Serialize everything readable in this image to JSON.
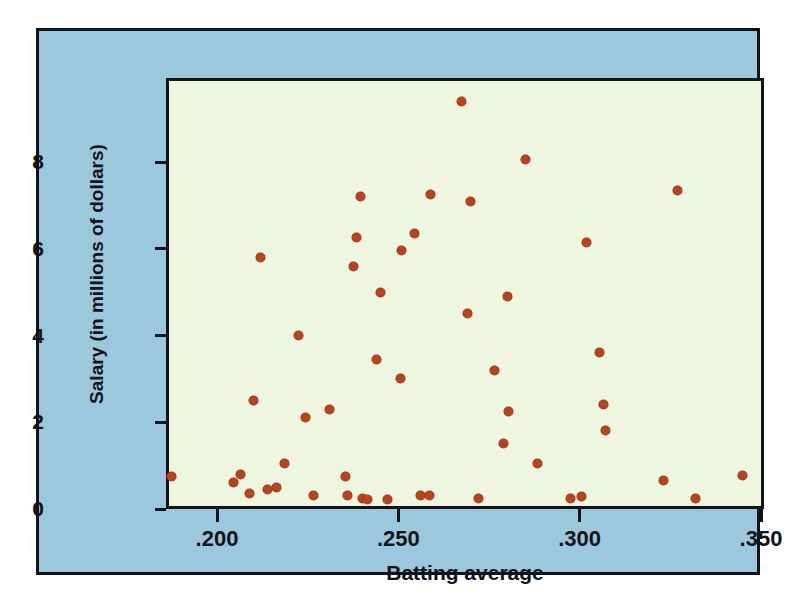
{
  "chart_data": {
    "type": "scatter",
    "title": "",
    "xlabel": "Batting average",
    "ylabel": "Salary (in millions of dollars)",
    "xlim": [
      0.186,
      0.35
    ],
    "ylim": [
      0,
      9.7
    ],
    "xticks": [
      ".200",
      ".250",
      ".300",
      ".350"
    ],
    "xtick_values": [
      0.2,
      0.25,
      0.3,
      0.35
    ],
    "yticks": [
      "0",
      "2",
      "4",
      "6",
      "8"
    ],
    "ytick_values": [
      0,
      2,
      4,
      6,
      8
    ],
    "grid": false,
    "legend": false,
    "marker_color": "#b8441f",
    "plot_background": "#eef6e0",
    "panel_background": "#9cc8dd",
    "axis_color": "#111318",
    "points": [
      {
        "x": 0.1875,
        "y": 0.75
      },
      {
        "x": 0.2045,
        "y": 0.6
      },
      {
        "x": 0.2065,
        "y": 0.8
      },
      {
        "x": 0.209,
        "y": 0.35
      },
      {
        "x": 0.21,
        "y": 2.5
      },
      {
        "x": 0.212,
        "y": 5.8
      },
      {
        "x": 0.214,
        "y": 0.45
      },
      {
        "x": 0.2165,
        "y": 0.5
      },
      {
        "x": 0.2185,
        "y": 1.05
      },
      {
        "x": 0.2225,
        "y": 4.0
      },
      {
        "x": 0.2245,
        "y": 2.1
      },
      {
        "x": 0.2265,
        "y": 0.3
      },
      {
        "x": 0.231,
        "y": 2.3
      },
      {
        "x": 0.2355,
        "y": 0.75
      },
      {
        "x": 0.236,
        "y": 0.3
      },
      {
        "x": 0.2375,
        "y": 5.6
      },
      {
        "x": 0.2385,
        "y": 6.25
      },
      {
        "x": 0.2395,
        "y": 7.2
      },
      {
        "x": 0.24,
        "y": 0.25
      },
      {
        "x": 0.2415,
        "y": 0.22
      },
      {
        "x": 0.244,
        "y": 3.45
      },
      {
        "x": 0.245,
        "y": 5.0
      },
      {
        "x": 0.247,
        "y": 0.22
      },
      {
        "x": 0.2505,
        "y": 3.0
      },
      {
        "x": 0.251,
        "y": 5.95
      },
      {
        "x": 0.2545,
        "y": 6.35
      },
      {
        "x": 0.256,
        "y": 0.32
      },
      {
        "x": 0.2585,
        "y": 0.3
      },
      {
        "x": 0.259,
        "y": 7.25
      },
      {
        "x": 0.2675,
        "y": 9.4
      },
      {
        "x": 0.269,
        "y": 4.5
      },
      {
        "x": 0.27,
        "y": 7.1
      },
      {
        "x": 0.272,
        "y": 0.25
      },
      {
        "x": 0.2765,
        "y": 3.2
      },
      {
        "x": 0.279,
        "y": 1.5
      },
      {
        "x": 0.28,
        "y": 4.9
      },
      {
        "x": 0.2805,
        "y": 2.25
      },
      {
        "x": 0.285,
        "y": 8.05
      },
      {
        "x": 0.2885,
        "y": 1.05
      },
      {
        "x": 0.2975,
        "y": 0.25
      },
      {
        "x": 0.3005,
        "y": 0.28
      },
      {
        "x": 0.302,
        "y": 6.15
      },
      {
        "x": 0.3055,
        "y": 3.6
      },
      {
        "x": 0.3065,
        "y": 2.4
      },
      {
        "x": 0.307,
        "y": 1.8
      },
      {
        "x": 0.323,
        "y": 0.65
      },
      {
        "x": 0.327,
        "y": 7.35
      },
      {
        "x": 0.332,
        "y": 0.25
      },
      {
        "x": 0.345,
        "y": 0.78
      }
    ]
  }
}
